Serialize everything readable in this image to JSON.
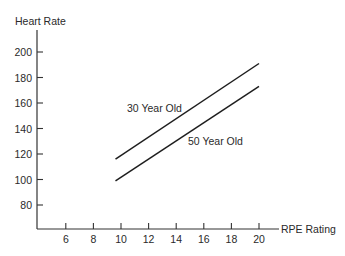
{
  "chart_data": {
    "type": "line",
    "title": "",
    "xlabel": "RPE Rating",
    "ylabel": "Heart Rate",
    "x_ticks": [
      6,
      8,
      10,
      12,
      14,
      16,
      18,
      20
    ],
    "y_ticks": [
      80,
      100,
      120,
      140,
      160,
      180,
      200
    ],
    "xlim": [
      4.2,
      21.4
    ],
    "ylim": [
      61,
      218
    ],
    "grid": false,
    "legend": "inline labels",
    "series": [
      {
        "name": "30 Year Old",
        "label_position": {
          "x": 127,
          "y": 112
        },
        "points": [
          {
            "x": 9.6,
            "y": 116
          },
          {
            "x": 20,
            "y": 191
          }
        ]
      },
      {
        "name": "50 Year Old",
        "label_position": {
          "x": 188,
          "y": 145
        },
        "points": [
          {
            "x": 9.6,
            "y": 99
          },
          {
            "x": 20,
            "y": 173
          }
        ]
      }
    ]
  },
  "colors": {
    "axis": "#333333",
    "line": "#1e1e1e",
    "text": "#2a2a2a",
    "background": "#ffffff"
  }
}
